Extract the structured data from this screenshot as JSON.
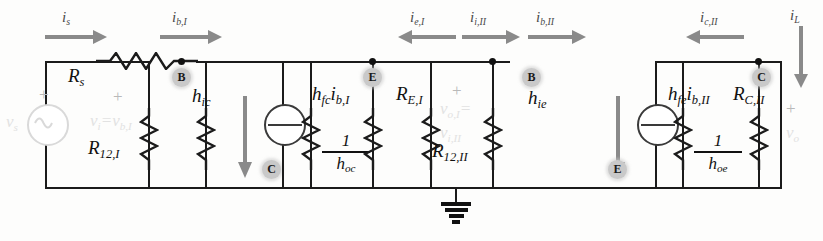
{
  "currents": {
    "i_s": "i",
    "i_s_sub": "s",
    "i_b1": "i",
    "i_b1_sub": "b,I",
    "i_e1": "i",
    "i_e1_sub": "e,I",
    "i_i2": "i",
    "i_i2_sub": "i,II",
    "i_b2": "i",
    "i_b2_sub": "b,II",
    "i_c2": "i",
    "i_c2_sub": "c,II",
    "i_L": "i",
    "i_L_sub": "L"
  },
  "arrow_labels": [
    {
      "name": "is",
      "base": "i",
      "sub": "s",
      "dir": "right"
    },
    {
      "name": "ib1",
      "base": "i",
      "sub": "b,I",
      "dir": "right"
    },
    {
      "name": "ie1",
      "base": "i",
      "sub": "e,I",
      "dir": "left"
    },
    {
      "name": "ii2",
      "base": "i",
      "sub": "i,II",
      "dir": "right"
    },
    {
      "name": "ib2",
      "base": "i",
      "sub": "b,II",
      "dir": "right"
    },
    {
      "name": "ic2",
      "base": "i",
      "sub": "c,II",
      "dir": "left"
    },
    {
      "name": "iL",
      "base": "i",
      "sub": "L",
      "dir": "down"
    }
  ],
  "components": {
    "rs": {
      "base": "R",
      "sub": "s"
    },
    "r12_1": {
      "base": "R",
      "sub": "12,I"
    },
    "hic": {
      "base": "h",
      "sub": "ic"
    },
    "hoc": {
      "num": "1",
      "base": "h",
      "sub": "oc"
    },
    "re_1": {
      "base": "R",
      "sub": "E,I"
    },
    "r12_2": {
      "base": "R",
      "sub": "12,II"
    },
    "hie": {
      "base": "h",
      "sub": "ie"
    },
    "hoe": {
      "num": "1",
      "base": "h",
      "sub": "oe"
    },
    "rc_2": {
      "base": "R",
      "sub": "C,II"
    }
  },
  "sources": {
    "vs": {
      "base": "v",
      "sub": "s",
      "type": "ac-voltage-source"
    },
    "hfc": {
      "gain": "h",
      "gain_sub": "fc",
      "cur": "i",
      "cur_sub": "b,I",
      "type": "current-source"
    },
    "hfe": {
      "gain": "h",
      "gain_sub": "fe",
      "cur": "i",
      "cur_sub": "b,II",
      "type": "current-source"
    }
  },
  "node_voltages": {
    "v_in": {
      "base": "v",
      "sub": "i",
      "eq": "=",
      "base2": "v",
      "sub2": "b,I"
    },
    "v_mid": {
      "base": "v",
      "sub": "o,I",
      "eq": "=",
      "base2": "v",
      "sub2": "i,II"
    },
    "v_out": {
      "base": "v",
      "sub": "o"
    }
  },
  "polarity": {
    "plus": "+"
  },
  "node_badges": [
    {
      "name": "b-stage1",
      "letter": "B"
    },
    {
      "name": "c-stage1",
      "letter": "C"
    },
    {
      "name": "e-stage1",
      "letter": "E"
    },
    {
      "name": "b-stage2",
      "letter": "B"
    },
    {
      "name": "e-stage2",
      "letter": "E"
    },
    {
      "name": "c-stage2",
      "letter": "C"
    }
  ],
  "ground": {
    "name": "ground-symbol"
  },
  "colors": {
    "wire": "#1b1b1b",
    "arrow": "#8a8a8a",
    "badge_bg": "#c9c9c9",
    "faded_text": "#e2e2e2",
    "paper": "#fdfdfc"
  }
}
